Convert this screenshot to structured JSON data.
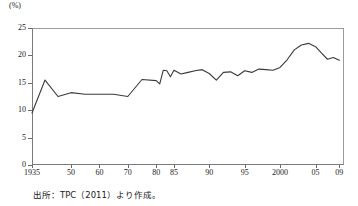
{
  "figure": {
    "unit_label": "(%)",
    "source_note": "出所：TPC（2011）より作成。"
  },
  "chart_data": {
    "type": "line",
    "title": "",
    "xlabel": "",
    "ylabel": "",
    "unit": "%",
    "ylim": [
      0,
      25
    ],
    "yticks": [
      0,
      5,
      10,
      15,
      20,
      25
    ],
    "ytick_labels": [
      "0",
      "5",
      "10",
      "15",
      "20",
      "25"
    ],
    "xtick_labels": [
      "1935",
      "50",
      "60",
      "70",
      "80",
      "85",
      "90",
      "95",
      "2000",
      "05",
      "09"
    ],
    "xtick_years": [
      1935,
      1950,
      1960,
      1970,
      1980,
      1985,
      1990,
      1995,
      2000,
      2005,
      2009
    ],
    "grid": false,
    "legend": "none",
    "line_color": "#3a3a3a",
    "axis_color": "#7a7a7a",
    "x": [
      1935,
      1940,
      1945,
      1950,
      1955,
      1960,
      1965,
      1970,
      1975,
      1980,
      1981,
      1982,
      1983,
      1984,
      1985,
      1986,
      1987,
      1988,
      1989,
      1990,
      1991,
      1992,
      1993,
      1994,
      1995,
      1996,
      1997,
      1998,
      1999,
      2000,
      2001,
      2002,
      2003,
      2004,
      2005,
      2006,
      2007,
      2008,
      2009
    ],
    "values": [
      9.5,
      15.5,
      12.5,
      13.2,
      12.9,
      12.9,
      12.9,
      12.5,
      15.6,
      15.4,
      14.8,
      17.3,
      17.2,
      16.1,
      17.3,
      16.6,
      16.9,
      17.2,
      17.4,
      16.7,
      15.5,
      16.9,
      17.0,
      16.3,
      17.2,
      16.9,
      17.5,
      17.4,
      17.3,
      17.8,
      19.2,
      21.0,
      21.9,
      22.2,
      21.6,
      20.4,
      19.3,
      19.6,
      19.1
    ]
  }
}
